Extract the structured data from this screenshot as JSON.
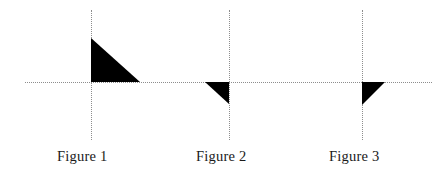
{
  "figure_set": {
    "background_color": "#ffffff",
    "axis_color": "#8d8d8d",
    "shape_color": "#000000",
    "axis_style": "dotted",
    "horizontal_axis": {
      "y": 82,
      "x_start": 25,
      "x_end": 432
    },
    "figures": [
      {
        "id": "figure-1",
        "caption": "Figure 1",
        "origin_x": 91,
        "origin_y": 82,
        "vertical_axis": {
          "y_top": 10,
          "y_bottom": 140
        },
        "caption_x": 57,
        "caption_y": 148,
        "triangle": {
          "quadrant": "upper-right",
          "width": 49,
          "height": 44,
          "right_angle_corner": "bottom-left",
          "vertices": [
            [
              0,
              -44
            ],
            [
              0,
              0
            ],
            [
              49,
              0
            ]
          ],
          "description": "right triangle above x-axis and right of y-axis, vertical leg on y-axis, horizontal leg on x-axis, hypotenuse from top-left to bottom-right"
        }
      },
      {
        "id": "figure-2",
        "caption": "Figure 2",
        "origin_x": 229,
        "origin_y": 82,
        "vertical_axis": {
          "y_top": 10,
          "y_bottom": 140
        },
        "caption_x": 196,
        "caption_y": 148,
        "triangle": {
          "quadrant": "lower-left",
          "width": 24,
          "height": 22,
          "right_angle_corner": "top-right",
          "vertices": [
            [
              -24,
              0
            ],
            [
              0,
              0
            ],
            [
              0,
              22
            ]
          ],
          "description": "right triangle below x-axis and left of y-axis, vertical leg on y-axis, horizontal leg on x-axis, hypotenuse from top-left to bottom-right"
        }
      },
      {
        "id": "figure-3",
        "caption": "Figure 3",
        "origin_x": 362,
        "origin_y": 82,
        "vertical_axis": {
          "y_top": 10,
          "y_bottom": 140
        },
        "caption_x": 329,
        "caption_y": 148,
        "triangle": {
          "quadrant": "lower-right",
          "width": 23,
          "height": 23,
          "right_angle_corner": "top-left",
          "vertices": [
            [
              0,
              0
            ],
            [
              23,
              0
            ],
            [
              0,
              23
            ]
          ],
          "description": "right triangle below x-axis and right of y-axis, vertical leg on y-axis, horizontal leg on x-axis, hypotenuse from top-right to bottom-left"
        }
      }
    ]
  }
}
